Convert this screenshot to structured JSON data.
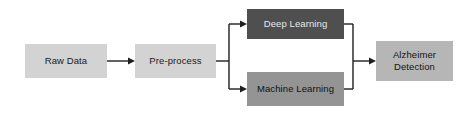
{
  "diagram": {
    "background_color": "#ffffff",
    "edge_color": "#1f1f1f",
    "nodes": [
      {
        "id": "raw-data",
        "label": "Raw Data",
        "fill": "#d3d3d3",
        "text_color": "#1a1a1a",
        "stage": "input"
      },
      {
        "id": "pre-process",
        "label": "Pre-process",
        "fill": "#d3d3d3",
        "text_color": "#1a1a1a",
        "stage": "processing"
      },
      {
        "id": "deep-learning",
        "label": "Deep Learning",
        "fill": "#4f4f4f",
        "text_color": "#e8e8e8",
        "stage": "model-branch-top"
      },
      {
        "id": "machine-learning",
        "label": "Machine Learning",
        "fill": "#949494",
        "text_color": "#111111",
        "stage": "model-branch-bottom"
      },
      {
        "id": "alzheimer-detection",
        "label": "Alzheimer Detection",
        "fill": "#b6b6b6",
        "text_color": "#141414",
        "stage": "output"
      }
    ],
    "edges": [
      {
        "id": "edge-raw-to-pre",
        "from": "raw-data",
        "to": "pre-process",
        "arrow": true
      },
      {
        "id": "edge-pre-to-dl",
        "from": "pre-process",
        "to": "deep-learning",
        "arrow": true
      },
      {
        "id": "edge-pre-to-ml",
        "from": "pre-process",
        "to": "machine-learning",
        "arrow": true
      },
      {
        "id": "edge-dl-to-result",
        "from": "deep-learning",
        "to": "alzheimer-detection",
        "arrow": true
      },
      {
        "id": "edge-ml-to-result",
        "from": "machine-learning",
        "to": "alzheimer-detection",
        "arrow": true
      }
    ]
  }
}
